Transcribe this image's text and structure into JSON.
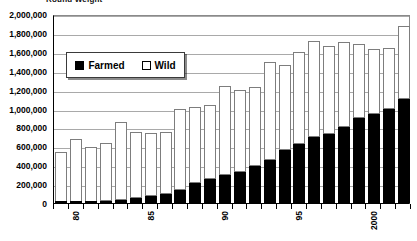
{
  "chart_data": {
    "type": "bar",
    "subtype": "stacked-column",
    "title": "Round Weight",
    "xlabel": "",
    "ylabel": "",
    "ylim": [
      0,
      2000000
    ],
    "ytick_step": 200000,
    "grid": true,
    "legend_position": "upper-left",
    "ytick_labels": [
      "2,000,000",
      "1,800,000",
      "1,600,000",
      "1,400,000",
      "1,200,000",
      "1,000,000",
      "800,000",
      "600,000",
      "400,000",
      "200,000",
      "0"
    ],
    "ytick_values": [
      2000000,
      1800000,
      1600000,
      1400000,
      1200000,
      1000000,
      800000,
      600000,
      400000,
      200000,
      0
    ],
    "categories": [
      "79",
      "80",
      "81",
      "82",
      "83",
      "84",
      "85",
      "86",
      "87",
      "88",
      "89",
      "90",
      "91",
      "92",
      "93",
      "94",
      "95",
      "96",
      "97",
      "98",
      "99",
      "2000",
      "01",
      "02"
    ],
    "xtick_labels_shown": [
      "80",
      "85",
      "90",
      "95",
      "2000"
    ],
    "xtick_label_indices": [
      1,
      6,
      11,
      16,
      21
    ],
    "series": [
      {
        "name": "Farmed",
        "color": "#000000",
        "values": [
          8000,
          10000,
          14000,
          20000,
          30000,
          50000,
          72000,
          100000,
          140000,
          210000,
          255000,
          300000,
          330000,
          390000,
          460000,
          560000,
          620000,
          700000,
          730000,
          800000,
          900000,
          940000,
          1000000,
          1100000
        ]
      },
      {
        "name": "Wild",
        "color": "#ffffff",
        "values": [
          532000,
          670000,
          576000,
          610000,
          830000,
          700000,
          670000,
          650000,
          860000,
          810000,
          785000,
          940000,
          870000,
          840000,
          1030000,
          900000,
          980000,
          1010000,
          930000,
          900000,
          780000,
          690000,
          640000,
          770000
        ]
      }
    ],
    "totals": [
      540000,
      680000,
      590000,
      630000,
      860000,
      750000,
      742000,
      750000,
      1000000,
      1020000,
      1040000,
      1240000,
      1200000,
      1230000,
      1490000,
      1460000,
      1600000,
      1710000,
      1660000,
      1700000,
      1680000,
      1630000,
      1640000,
      1870000
    ]
  },
  "legend": {
    "items": [
      {
        "label": "Farmed",
        "swatch": "filled-square"
      },
      {
        "label": "Wild",
        "swatch": "hollow-square"
      }
    ]
  }
}
